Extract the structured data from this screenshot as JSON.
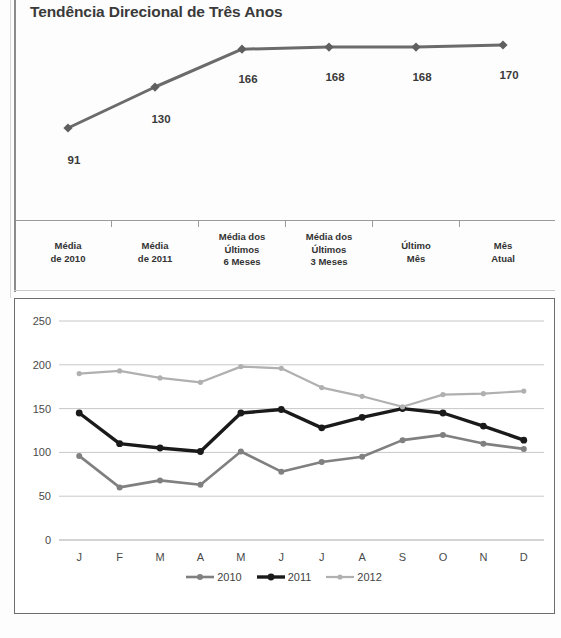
{
  "trend": {
    "title": "Tendência Direcional de Três Anos",
    "categories": [
      {
        "lines": [
          "Média",
          "de 2010"
        ]
      },
      {
        "lines": [
          "Média",
          "de 2011"
        ]
      },
      {
        "lines": [
          "Média dos",
          "Últimos",
          "6 Meses"
        ]
      },
      {
        "lines": [
          "Média dos",
          "Últimos",
          "3 Meses"
        ]
      },
      {
        "lines": [
          "Último",
          "Mês"
        ]
      },
      {
        "lines": [
          "Mês",
          "Atual"
        ]
      }
    ],
    "labels": [
      "91",
      "130",
      "166",
      "168",
      "168",
      "170"
    ],
    "line_color": "#6b6b6b",
    "marker_color": "#5f5f5f"
  },
  "monthly": {
    "y_ticks": [
      "0",
      "50",
      "100",
      "150",
      "200",
      "250"
    ],
    "x_ticks": [
      "J",
      "F",
      "M",
      "A",
      "M",
      "J",
      "J",
      "A",
      "S",
      "O",
      "N",
      "D"
    ],
    "legend": [
      {
        "label": "2010",
        "color": "#808080"
      },
      {
        "label": "2011",
        "color": "#1a1a1a"
      },
      {
        "label": "2012",
        "color": "#b0b0b0"
      }
    ]
  },
  "chart_data": [
    {
      "type": "line",
      "title": "Tendência Direcional de Três Anos",
      "xlabel": "",
      "ylabel": "",
      "grid": false,
      "legend": "none",
      "categories": [
        "Média de 2010",
        "Média de 2011",
        "Média dos Últimos 6 Meses",
        "Média dos Últimos 3 Meses",
        "Último Mês",
        "Mês Atual"
      ],
      "values": [
        91,
        130,
        166,
        168,
        168,
        170
      ],
      "data_labels": [
        "91",
        "130",
        "166",
        "168",
        "168",
        "170"
      ],
      "ylim": [
        80,
        180
      ]
    },
    {
      "type": "line",
      "title": "",
      "xlabel": "",
      "ylabel": "",
      "grid": true,
      "legend": "bottom",
      "categories": [
        "J",
        "F",
        "M",
        "A",
        "M",
        "J",
        "J",
        "A",
        "S",
        "O",
        "N",
        "D"
      ],
      "ylim": [
        0,
        250
      ],
      "yticks": [
        0,
        50,
        100,
        150,
        200,
        250
      ],
      "series": [
        {
          "name": "2010",
          "color": "#808080",
          "values": [
            96,
            60,
            68,
            63,
            101,
            78,
            89,
            95,
            114,
            120,
            110,
            104
          ]
        },
        {
          "name": "2011",
          "color": "#1a1a1a",
          "values": [
            145,
            110,
            105,
            101,
            145,
            149,
            128,
            140,
            150,
            145,
            130,
            114
          ]
        },
        {
          "name": "2012",
          "color": "#b0b0b0",
          "values": [
            190,
            193,
            185,
            180,
            198,
            196,
            174,
            164,
            152,
            166,
            167,
            170
          ]
        }
      ]
    }
  ]
}
